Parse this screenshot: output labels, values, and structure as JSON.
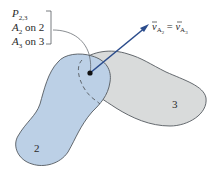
{
  "diagram": {
    "point_label": {
      "base": "P",
      "sub": "2,3"
    },
    "coincident_points": [
      {
        "base": "A",
        "sub": "2",
        "rest": " on 2"
      },
      {
        "base": "A",
        "sub": "3",
        "rest": " on 3"
      }
    ],
    "velocity_label": {
      "lhs": {
        "base": "v",
        "sub": "A",
        "subsub": "2"
      },
      "eq": " = ",
      "rhs": {
        "base": "v",
        "sub": "A",
        "subsub": "3"
      }
    },
    "body_labels": {
      "body2": "2",
      "body3": "3"
    },
    "colors": {
      "body2_fill": "#bcd0e6",
      "body3_fill": "#d9dbdb",
      "outline": "#555a60",
      "arrow": "#2b4c8c",
      "text": "#2a2a2a"
    }
  }
}
